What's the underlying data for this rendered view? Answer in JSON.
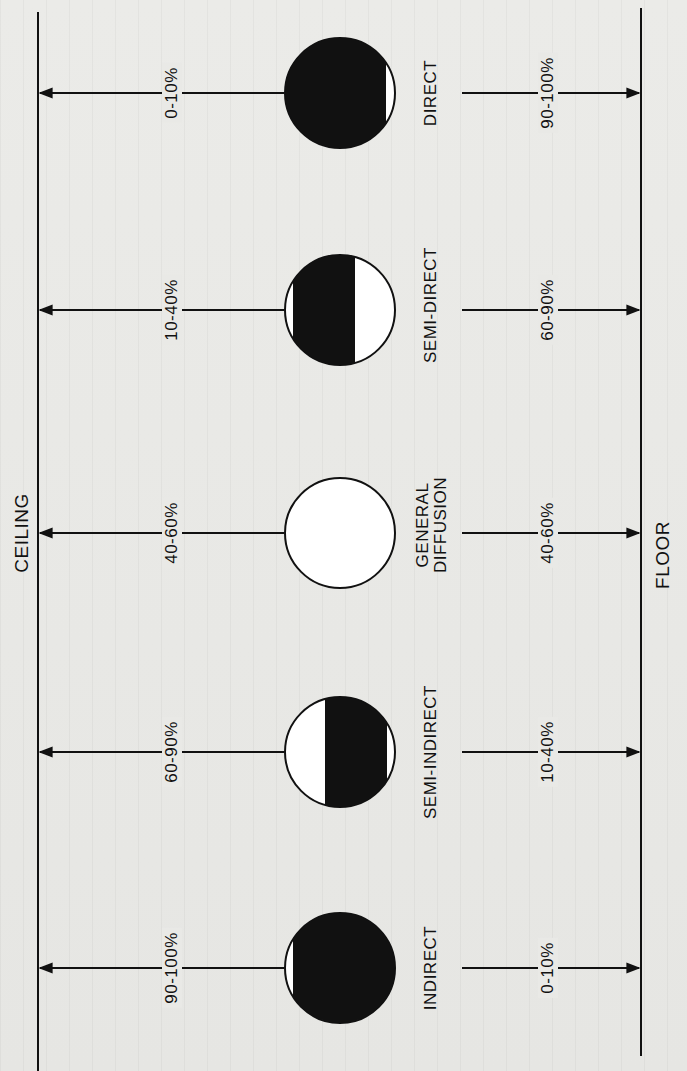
{
  "diagram": {
    "ceiling_label": "CEILING",
    "floor_label": "FLOOR",
    "colors": {
      "ink": "#111111",
      "paper": "#e9e9e6",
      "fill": "#ffffff"
    },
    "types": [
      {
        "name": "DIRECT",
        "name_line2": "",
        "ceiling_pct": "0-10%",
        "floor_pct": "90-100%",
        "center_y": 93
      },
      {
        "name": "SEMI-DIRECT",
        "name_line2": "",
        "ceiling_pct": "10-40%",
        "floor_pct": "60-90%",
        "center_y": 310
      },
      {
        "name": "GENERAL",
        "name_line2": "DIFFUSION",
        "ceiling_pct": "40-60%",
        "floor_pct": "40-60%",
        "center_y": 533
      },
      {
        "name": "SEMI-INDIRECT",
        "name_line2": "",
        "ceiling_pct": "60-90%",
        "floor_pct": "10-40%",
        "center_y": 752
      },
      {
        "name": "INDIRECT",
        "name_line2": "",
        "ceiling_pct": "90-100%",
        "floor_pct": "0-10%",
        "center_y": 968
      }
    ]
  }
}
